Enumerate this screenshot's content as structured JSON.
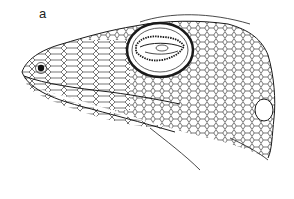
{
  "figure": {
    "panel_label": "a",
    "colors": {
      "ink": "#1a1a1a",
      "background": "#ffffff"
    }
  }
}
